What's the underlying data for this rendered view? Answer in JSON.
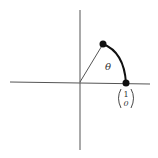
{
  "diagram": {
    "type": "unit-circle-rotation",
    "angle_label": "θ",
    "vector_label": {
      "top": "1",
      "bottom": "0"
    },
    "colors": {
      "axis": "#555555",
      "arc": "#111111",
      "point": "#111111",
      "background": "#ffffff"
    }
  }
}
